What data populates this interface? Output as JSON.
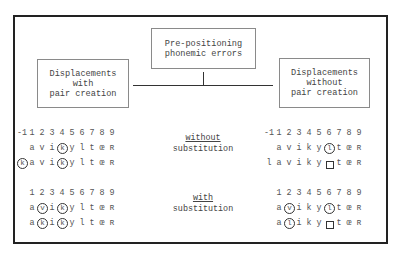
{
  "diagram": {
    "root": {
      "lines": [
        "Pre-positioning",
        "phonemic errors"
      ]
    },
    "left": {
      "lines": [
        "Displacements",
        "with",
        "pair creation"
      ]
    },
    "right": {
      "lines": [
        "Displacements",
        "without",
        "pair creation"
      ]
    },
    "middle_labels": {
      "without": {
        "key": "without",
        "rest": "substitution"
      },
      "with": {
        "key": "with",
        "rest": "substitution"
      }
    },
    "left_panel": {
      "without_sub": {
        "positions": [
          "-1",
          "1",
          "2",
          "3",
          "4",
          "5",
          "6",
          "7",
          "8",
          "9"
        ],
        "row1": [
          {
            "t": ""
          },
          {
            "t": "a"
          },
          {
            "t": "v"
          },
          {
            "t": "i"
          },
          {
            "t": "k",
            "c": true
          },
          {
            "t": "y"
          },
          {
            "t": "l"
          },
          {
            "t": "t"
          },
          {
            "t": "œ"
          },
          {
            "t": "ʀ"
          }
        ],
        "row2": [
          {
            "t": "k",
            "c": true
          },
          {
            "t": "a"
          },
          {
            "t": "v"
          },
          {
            "t": "i"
          },
          {
            "t": "k",
            "c": true
          },
          {
            "t": "y"
          },
          {
            "t": "l"
          },
          {
            "t": "t"
          },
          {
            "t": "œ"
          },
          {
            "t": "ʀ"
          }
        ]
      },
      "with_sub": {
        "positions": [
          "",
          "1",
          "2",
          "3",
          "4",
          "5",
          "6",
          "7",
          "8",
          "9"
        ],
        "row1": [
          {
            "t": ""
          },
          {
            "t": "a"
          },
          {
            "t": "v",
            "c": true
          },
          {
            "t": "i"
          },
          {
            "t": "k",
            "c": true
          },
          {
            "t": "y"
          },
          {
            "t": "l"
          },
          {
            "t": "t"
          },
          {
            "t": "œ"
          },
          {
            "t": "ʀ"
          }
        ],
        "row2": [
          {
            "t": ""
          },
          {
            "t": "a"
          },
          {
            "t": "k",
            "c": true
          },
          {
            "t": "i"
          },
          {
            "t": "k",
            "c": true
          },
          {
            "t": "y"
          },
          {
            "t": "l"
          },
          {
            "t": "t"
          },
          {
            "t": "œ"
          },
          {
            "t": "ʀ"
          }
        ]
      }
    },
    "right_panel": {
      "without_sub": {
        "positions": [
          "-1",
          "1",
          "2",
          "3",
          "4",
          "5",
          "6",
          "7",
          "8",
          "9"
        ],
        "row1": [
          {
            "t": ""
          },
          {
            "t": "a"
          },
          {
            "t": "v"
          },
          {
            "t": "i"
          },
          {
            "t": "k"
          },
          {
            "t": "y"
          },
          {
            "t": "l",
            "c": true
          },
          {
            "t": "t"
          },
          {
            "t": "œ"
          },
          {
            "t": "ʀ"
          }
        ],
        "row2": [
          {
            "t": "l"
          },
          {
            "t": "a"
          },
          {
            "t": "v"
          },
          {
            "t": "i"
          },
          {
            "t": "k"
          },
          {
            "t": "y"
          },
          {
            "t": "",
            "sq": true
          },
          {
            "t": "t"
          },
          {
            "t": "œ"
          },
          {
            "t": "ʀ"
          }
        ]
      },
      "with_sub": {
        "positions": [
          "",
          "1",
          "2",
          "3",
          "4",
          "5",
          "6",
          "7",
          "8",
          "9"
        ],
        "row1": [
          {
            "t": ""
          },
          {
            "t": "a"
          },
          {
            "t": "v",
            "c": true
          },
          {
            "t": "i"
          },
          {
            "t": "k"
          },
          {
            "t": "y"
          },
          {
            "t": "l",
            "c": true
          },
          {
            "t": "t"
          },
          {
            "t": "œ"
          },
          {
            "t": "ʀ"
          }
        ],
        "row2": [
          {
            "t": ""
          },
          {
            "t": "a"
          },
          {
            "t": "l",
            "c": true
          },
          {
            "t": "i"
          },
          {
            "t": "k"
          },
          {
            "t": "y"
          },
          {
            "t": "",
            "sq": true
          },
          {
            "t": "t"
          },
          {
            "t": "œ"
          },
          {
            "t": "ʀ"
          }
        ]
      }
    }
  }
}
